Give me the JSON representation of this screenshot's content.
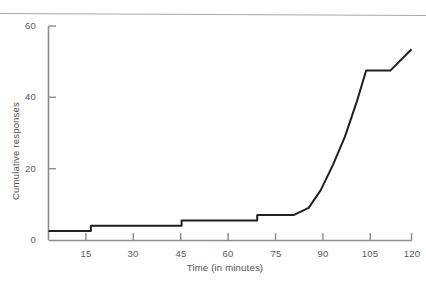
{
  "chart_data": {
    "type": "line",
    "title": "",
    "subtitle": "",
    "xlabel": "Time (in minutes)",
    "ylabel": "Cumulative responses",
    "xlim": [
      0,
      120
    ],
    "ylim": [
      0,
      60
    ],
    "xticks": [
      15,
      30,
      45,
      60,
      75,
      90,
      105,
      120
    ],
    "xtick_labels": [
      "15",
      "30",
      "45",
      "60",
      "75",
      "90",
      "105",
      "120"
    ],
    "yticks": [
      0,
      20,
      40,
      60
    ],
    "ytick_labels": [
      "0",
      "20",
      "40",
      "60"
    ],
    "grid": false,
    "legend": null,
    "legend_position": "none",
    "annotations": [],
    "series": [
      {
        "name": "Cumulative responses",
        "color": "#231f20",
        "line_width": 2,
        "points": [
          {
            "x": 0,
            "y": 2.5
          },
          {
            "x": 14,
            "y": 2.5
          },
          {
            "x": 14,
            "y": 4
          },
          {
            "x": 44,
            "y": 4
          },
          {
            "x": 44,
            "y": 5.5
          },
          {
            "x": 69,
            "y": 5.5
          },
          {
            "x": 69,
            "y": 7
          },
          {
            "x": 81,
            "y": 7
          },
          {
            "x": 86,
            "y": 9
          },
          {
            "x": 90,
            "y": 14
          },
          {
            "x": 94,
            "y": 21
          },
          {
            "x": 98,
            "y": 29
          },
          {
            "x": 102,
            "y": 39
          },
          {
            "x": 105,
            "y": 47.5
          },
          {
            "x": 113,
            "y": 47.5
          },
          {
            "x": 120,
            "y": 53.5
          }
        ]
      }
    ]
  },
  "axes": {
    "y_axis_color": "#8d8d8f",
    "x_axis_color": "#8d8d8f",
    "tick_color": "#8d8d8f",
    "label_color": "#59595b"
  },
  "figure": {
    "background": "#ffffff",
    "top_rule_color": "#a9a9a9"
  }
}
